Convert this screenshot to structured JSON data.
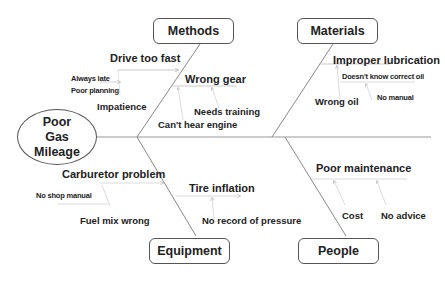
{
  "effect": {
    "lines": [
      "Poor",
      "Gas",
      "Mileage"
    ]
  },
  "categories": {
    "methods": {
      "label": "Methods",
      "causes": {
        "drive_too_fast": {
          "label": "Drive too fast",
          "subcauses": [
            "Always late",
            "Poor planning",
            "Impatience"
          ]
        },
        "wrong_gear": {
          "label": "Wrong gear",
          "subcauses": [
            "Needs training",
            "Can't hear engine"
          ]
        }
      }
    },
    "materials": {
      "label": "Materials",
      "causes": {
        "improper_lubrication": {
          "label": "Improper lubrication",
          "subcauses": [
            "Doesn't know correct oil",
            "No manual",
            "Wrong oil"
          ]
        }
      }
    },
    "equipment": {
      "label": "Equipment",
      "causes": {
        "carburetor_problem": {
          "label": "Carburetor problem",
          "subcauses": [
            "No shop manual",
            "Fuel mix wrong"
          ]
        },
        "tire_inflation": {
          "label": "Tire inflation",
          "subcauses": [
            "No record of pressure"
          ]
        }
      }
    },
    "people": {
      "label": "People",
      "causes": {
        "poor_maintenance": {
          "label": "Poor maintenance",
          "subcauses": [
            "Cost",
            "No advice"
          ]
        }
      }
    }
  },
  "colors": {
    "line": "#999999",
    "spine": "#888888",
    "border": "#555555",
    "text": "#222222"
  }
}
